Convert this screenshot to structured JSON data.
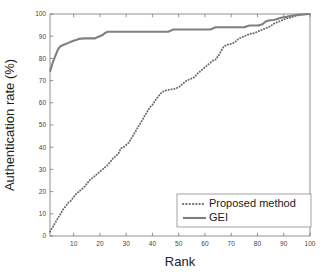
{
  "chart_data": {
    "type": "line",
    "title": "",
    "xlabel": "Rank",
    "ylabel": "Authentication rate (%)",
    "xlim": [
      1,
      100
    ],
    "ylim": [
      0,
      100
    ],
    "grid": false,
    "legend_position": "lower-right",
    "xticks": [
      10,
      20,
      30,
      40,
      50,
      60,
      70,
      80,
      90,
      100
    ],
    "xtick_labels": [
      "10",
      "20",
      "30",
      "40",
      "50",
      "60",
      "70",
      "80",
      "90",
      "100"
    ],
    "yticks": [
      0,
      10,
      20,
      30,
      40,
      50,
      60,
      70,
      80,
      90,
      100
    ],
    "ytick_labels": [
      "0",
      "10",
      "20",
      "30",
      "40",
      "50",
      "60",
      "70",
      "80",
      "90",
      "100"
    ],
    "x": [
      1,
      2,
      3,
      4,
      5,
      6,
      7,
      8,
      9,
      10,
      11,
      12,
      13,
      14,
      15,
      16,
      17,
      18,
      19,
      20,
      21,
      22,
      23,
      24,
      25,
      26,
      27,
      28,
      29,
      30,
      31,
      32,
      33,
      34,
      35,
      36,
      37,
      38,
      39,
      40,
      41,
      42,
      43,
      44,
      45,
      46,
      47,
      48,
      49,
      50,
      51,
      52,
      53,
      54,
      55,
      56,
      57,
      58,
      59,
      60,
      61,
      62,
      63,
      64,
      65,
      66,
      67,
      68,
      69,
      70,
      71,
      72,
      73,
      74,
      75,
      76,
      77,
      78,
      79,
      80,
      81,
      82,
      83,
      84,
      85,
      86,
      87,
      88,
      89,
      90,
      91,
      92,
      93,
      94,
      95,
      96,
      97,
      98,
      99,
      100
    ],
    "series": [
      {
        "name": "Proposed method",
        "style": "dotted",
        "color": "#6b6b6b",
        "values": [
          2,
          4,
          6,
          8,
          10,
          12,
          13.5,
          15,
          16,
          17.5,
          19,
          20,
          21,
          22,
          23.5,
          25,
          26,
          27,
          28,
          29,
          30,
          31,
          32,
          33.5,
          35,
          36,
          37,
          39.5,
          40,
          41,
          42,
          44,
          46,
          48,
          50,
          52,
          54,
          56,
          58,
          59,
          61,
          62.5,
          64,
          65,
          65.5,
          65.8,
          66,
          66.2,
          66.5,
          67,
          68,
          69,
          70,
          70.5,
          71,
          71.5,
          73,
          74,
          75,
          76,
          77,
          78,
          79,
          79.5,
          81,
          83,
          85,
          86,
          86.3,
          86.5,
          87,
          88,
          89,
          89.5,
          90,
          90.5,
          91,
          91.2,
          91.5,
          92,
          92.5,
          93,
          93.5,
          94,
          94.5,
          95.5,
          96,
          96.5,
          97,
          97.5,
          98,
          98.2,
          98.5,
          99,
          99.3,
          99.5,
          99.7,
          99.8,
          99.9,
          100
        ]
      },
      {
        "name": "GEI",
        "style": "solid",
        "color": "#808080",
        "values": [
          74,
          78,
          81,
          84,
          85.5,
          86,
          86.5,
          87,
          87.5,
          88,
          88.3,
          88.8,
          88.9,
          89,
          89,
          89,
          89,
          89,
          89.5,
          90,
          90.5,
          91.5,
          92,
          92,
          92,
          92,
          92,
          92,
          92,
          92,
          92,
          92,
          92,
          92,
          92,
          92,
          92,
          92,
          92,
          92,
          92,
          92,
          92,
          92,
          92,
          92,
          92.5,
          93,
          93,
          93,
          93,
          93,
          93,
          93,
          93,
          93,
          93,
          93,
          93,
          93,
          93,
          93,
          93.5,
          94,
          94,
          94,
          94,
          94,
          94,
          94,
          94,
          94,
          94,
          94,
          94,
          94.5,
          94.8,
          94.8,
          94.8,
          94.8,
          95,
          95.5,
          96.5,
          97,
          97.2,
          97.3,
          97.5,
          98,
          98.3,
          98.5,
          98.7,
          99,
          99.2,
          99.4,
          99.6,
          99.7,
          99.8,
          99.9,
          100,
          100
        ]
      }
    ]
  },
  "legend": {
    "entries": [
      {
        "label": "Proposed method",
        "style": "dotted"
      },
      {
        "label": "GEI",
        "style": "solid"
      }
    ]
  }
}
